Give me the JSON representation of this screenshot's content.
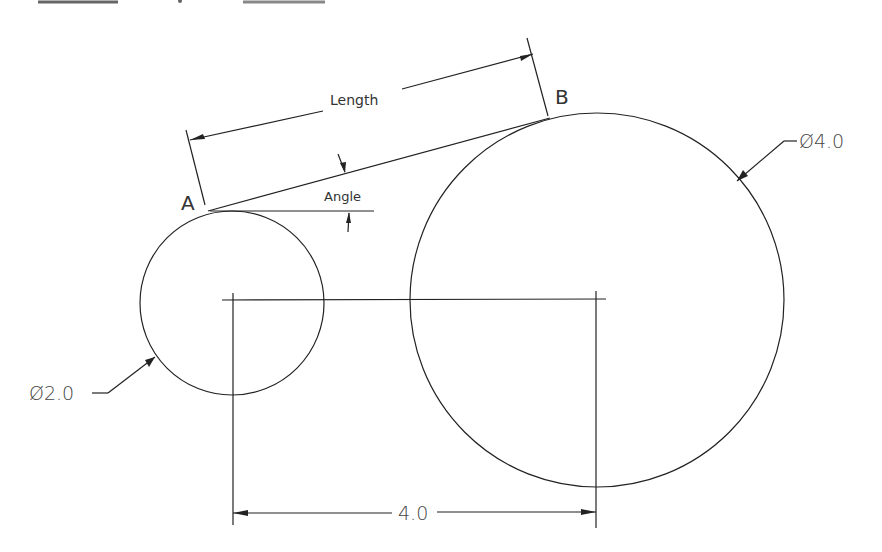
{
  "drawing": {
    "points": {
      "a": "A",
      "b": "B"
    },
    "labels": {
      "length": "Length",
      "angle": "Angle",
      "small_diameter": "Ø2.0",
      "large_diameter": "Ø4.0",
      "center_distance": "4.0"
    },
    "top_fragments": [
      "",
      "",
      ""
    ]
  }
}
